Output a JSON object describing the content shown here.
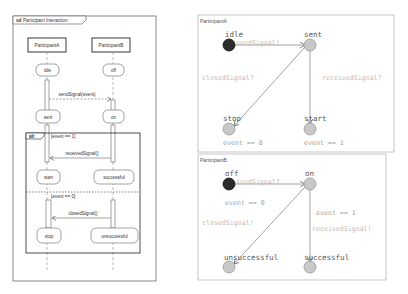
{
  "sequence_diagram": {
    "frame_keyword": "sd",
    "frame_title": "Participant Interaction",
    "participants": [
      "ParticipantA",
      "ParticipantB"
    ],
    "states_a": [
      "idle",
      "sent",
      "start",
      "stop"
    ],
    "states_b": [
      "off",
      "on",
      "successful",
      "unsuccessful"
    ],
    "messages": {
      "send": "sendSignal(event)",
      "received": "receivedSignal()",
      "closed": "closedSignal()"
    },
    "alt": {
      "keyword": "alt",
      "guard1": "[event == 1]",
      "guard2": "[event == 0]"
    }
  },
  "automaton_a": {
    "title": "ParticipantA",
    "states": {
      "idle": "idle",
      "sent": "sent",
      "stop": "stop",
      "start": "start"
    },
    "edges": {
      "idle_sent": "sendSignal!",
      "sent_stop": "closedSignal?",
      "sent_start": "receivedSignal?"
    },
    "invariants": {
      "stop": "event == 0",
      "start": "event == 1"
    }
  },
  "automaton_b": {
    "title": "ParticipantB",
    "states": {
      "off": "off",
      "on": "on",
      "unsuccessful": "unsuccessful",
      "successful": "successful"
    },
    "edges": {
      "off_on": "sendSignal?",
      "on_unsuccessful": "closedSignal!",
      "on_successful": "receivedSignal!"
    },
    "guards": {
      "unsuccessful": "event == 0",
      "successful": "event == 1"
    }
  },
  "colors": {
    "initial_state": "#2b2b2b",
    "state_fill": "#c8c8c8",
    "edge": "#7a7a7a",
    "panel_border": "#b8b8b8"
  }
}
